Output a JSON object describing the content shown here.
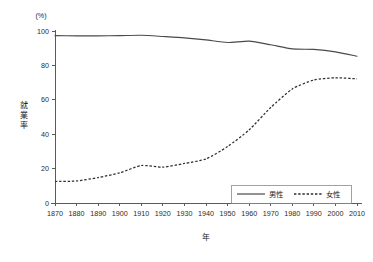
{
  "chart_data": {
    "type": "line",
    "title": "",
    "xlabel": "年",
    "ylabel": "就業率",
    "yunit": "(%)",
    "xlim": [
      1870,
      2010
    ],
    "ylim": [
      0,
      100
    ],
    "grid": false,
    "legend_position": "bottom-right",
    "x_ticks": [
      1870,
      1880,
      1890,
      1900,
      1910,
      1920,
      1930,
      1940,
      1950,
      1960,
      1970,
      1980,
      1990,
      2000,
      2010
    ],
    "y_ticks": [
      0,
      20,
      40,
      60,
      80,
      100
    ],
    "x": [
      1870,
      1880,
      1890,
      1900,
      1910,
      1920,
      1930,
      1940,
      1950,
      1960,
      1970,
      1980,
      1990,
      2000,
      2010
    ],
    "series": [
      {
        "name": "男性",
        "style": "solid",
        "color": "#4a4a4a",
        "values": [
          97.3,
          97.2,
          97.2,
          97.3,
          97.5,
          96.8,
          96.0,
          94.8,
          93.3,
          94.1,
          92.0,
          89.6,
          89.3,
          87.9,
          85.3
        ]
      },
      {
        "name": "女性",
        "style": "dashed",
        "color": "#2e2e2e",
        "values": [
          12.5,
          12.8,
          14.8,
          17.5,
          21.8,
          20.8,
          23.0,
          25.6,
          32.8,
          42.5,
          55.5,
          66.3,
          71.5,
          72.8,
          72.2
        ]
      }
    ],
    "legend": [
      {
        "label": "男性",
        "style": "solid"
      },
      {
        "label": "女性",
        "style": "dashed"
      }
    ]
  },
  "layout": {
    "plot_left": 55,
    "plot_right": 357,
    "plot_top": 31,
    "plot_bottom": 203,
    "legend_x": 231,
    "legend_y": 185,
    "legend_w": 120,
    "legend_h": 18
  }
}
